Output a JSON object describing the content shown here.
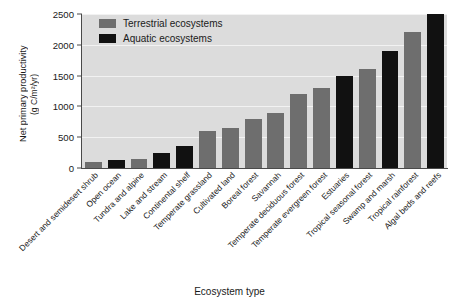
{
  "chart_data": {
    "type": "bar",
    "title": "",
    "xlabel": "Ecosystem type",
    "ylabel": "Net primary productivity (g C/m²/yr)",
    "ylabel_line1": "Net primary productivity",
    "ylabel_line2": "(g C/m²/yr)",
    "ylim": [
      0,
      2500
    ],
    "yticks": [
      0,
      500,
      1000,
      1500,
      2000,
      2500
    ],
    "ytick_labels": [
      "0",
      "500",
      "1000",
      "1500",
      "2000",
      "2500"
    ],
    "grid": true,
    "grid_color": "#f2f2f2",
    "plot_background": "#dcdcdc",
    "legend_position": "top-left",
    "categories": [
      "Desert and semidesert shrub",
      "Open ocean",
      "Tundra and alpine",
      "Lake and stream",
      "Continental shelf",
      "Temperate grassland",
      "Cultivated land",
      "Boreal forest",
      "Savannah",
      "Temperate deciduous forest",
      "Temperate evergreen forest",
      "Estuaries",
      "Tropical seasonal forest",
      "Swamp and marsh",
      "Tropical rainforest",
      "Algal beds and reefs"
    ],
    "values": [
      90,
      125,
      140,
      250,
      360,
      600,
      650,
      800,
      900,
      1200,
      1300,
      1500,
      1600,
      1900,
      2200,
      2500
    ],
    "group_of_bar": [
      "Terrestrial ecosystems",
      "Aquatic ecosystems",
      "Terrestrial ecosystems",
      "Aquatic ecosystems",
      "Aquatic ecosystems",
      "Terrestrial ecosystems",
      "Terrestrial ecosystems",
      "Terrestrial ecosystems",
      "Terrestrial ecosystems",
      "Terrestrial ecosystems",
      "Terrestrial ecosystems",
      "Aquatic ecosystems",
      "Terrestrial ecosystems",
      "Aquatic ecosystems",
      "Terrestrial ecosystems",
      "Aquatic ecosystems"
    ],
    "series": [
      {
        "name": "Terrestrial ecosystems",
        "color": "#6e6e6e",
        "points": [
          {
            "category": "Desert and semidesert shrub",
            "value": 90
          },
          {
            "category": "Tundra and alpine",
            "value": 140
          },
          {
            "category": "Temperate grassland",
            "value": 600
          },
          {
            "category": "Cultivated land",
            "value": 650
          },
          {
            "category": "Boreal forest",
            "value": 800
          },
          {
            "category": "Savannah",
            "value": 900
          },
          {
            "category": "Temperate deciduous forest",
            "value": 1200
          },
          {
            "category": "Temperate evergreen forest",
            "value": 1300
          },
          {
            "category": "Tropical seasonal forest",
            "value": 1600
          },
          {
            "category": "Tropical rainforest",
            "value": 2200
          }
        ]
      },
      {
        "name": "Aquatic ecosystems",
        "color": "#111111",
        "points": [
          {
            "category": "Open ocean",
            "value": 125
          },
          {
            "category": "Lake and stream",
            "value": 250
          },
          {
            "category": "Continental shelf",
            "value": 360
          },
          {
            "category": "Estuaries",
            "value": 1500
          },
          {
            "category": "Swamp and marsh",
            "value": 1900
          },
          {
            "category": "Algal beds and reefs",
            "value": 2500
          }
        ]
      }
    ]
  },
  "legend": {
    "items": [
      {
        "label": "Terrestrial ecosystems",
        "color": "#6e6e6e"
      },
      {
        "label": "Aquatic ecosystems",
        "color": "#111111"
      }
    ]
  }
}
